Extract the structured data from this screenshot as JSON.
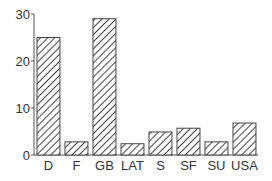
{
  "chart_data": {
    "type": "bar",
    "title": "",
    "xlabel": "",
    "ylabel": "",
    "categories": [
      "D",
      "F",
      "GB",
      "LAT",
      "S",
      "SF",
      "SU",
      "USA"
    ],
    "values": [
      25,
      2.8,
      29,
      2.4,
      4.9,
      5.7,
      2.8,
      6.8
    ],
    "ylim": [
      0,
      30
    ],
    "yticks": [
      0,
      10,
      20,
      30
    ],
    "grid": false,
    "legend": "none",
    "bar_fill": "diagonal-hatch",
    "colors": {
      "bar_stroke": "#444444",
      "hatch": "#444444",
      "axis": "#555555",
      "text": "#333333"
    }
  }
}
